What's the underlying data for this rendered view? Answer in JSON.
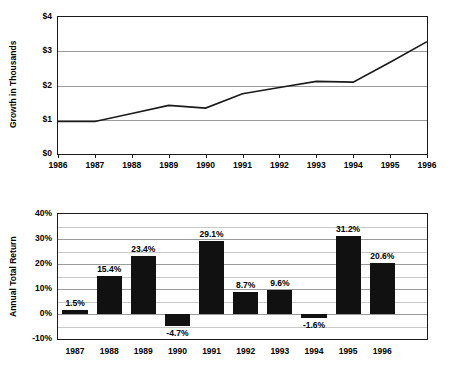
{
  "chart_data": [
    {
      "type": "line",
      "title": "",
      "ylabel": "Growth in Thousands",
      "xlabel": "",
      "x": [
        1986,
        1987,
        1988,
        1989,
        1990,
        1991,
        1992,
        1993,
        1994,
        1995,
        1996
      ],
      "xticklabels": [
        "1986",
        "1987",
        "1988",
        "1989",
        "1990",
        "1991",
        "1992",
        "1993",
        "1994",
        "1995",
        "1996"
      ],
      "values": [
        0.95,
        0.95,
        1.18,
        1.42,
        1.34,
        1.76,
        1.94,
        2.12,
        2.1,
        2.68,
        3.28
      ],
      "yticklabels": [
        "$4",
        "$3",
        "$2",
        "$1",
        "$0"
      ],
      "ytickvalues": [
        4,
        3,
        2,
        1,
        0
      ],
      "ylim": [
        0,
        4
      ],
      "grid": true,
      "legend": "none"
    },
    {
      "type": "bar",
      "title": "",
      "ylabel": "Annual Total Return",
      "xlabel": "",
      "categories": [
        "1987",
        "1988",
        "1989",
        "1990",
        "1991",
        "1992",
        "1993",
        "1994",
        "1995",
        "1996"
      ],
      "values": [
        1.5,
        15.4,
        23.4,
        -4.7,
        29.1,
        8.7,
        9.6,
        -1.6,
        31.2,
        20.6
      ],
      "datalabels": [
        "1.5%",
        "15.4%",
        "23.4%",
        "-4.7%",
        "29.1%",
        "8.7%",
        "9.6%",
        "-1.6%",
        "31.2%",
        "20.6%"
      ],
      "yticklabels": [
        "40%",
        "30%",
        "20%",
        "10%",
        "0%",
        "-10%"
      ],
      "ytickvalues": [
        40,
        30,
        20,
        10,
        0,
        -10
      ],
      "ylim": [
        -10,
        40
      ],
      "gridstep": 5,
      "grid": true,
      "legend": "none",
      "barcolor": "#111111"
    }
  ]
}
